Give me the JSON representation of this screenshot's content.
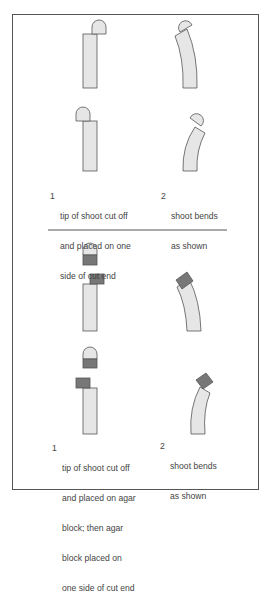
{
  "figure": {
    "top_experiment": {
      "step1_number": "1",
      "step1_caption": [
        "tip of shoot cut off",
        "and placed on one",
        "side of cut end"
      ],
      "step2_number": "2",
      "step2_caption": [
        "shoot bends",
        "as shown"
      ]
    },
    "bottom_experiment": {
      "step1_number": "1",
      "step1_caption": [
        "tip of shoot cut off",
        "and placed on agar",
        "block; then agar",
        "block placed on",
        "one side of cut end"
      ],
      "step2_number": "2",
      "step2_caption": [
        "shoot bends",
        "as shown"
      ]
    },
    "colors": {
      "stem_fill": "#e6e6e6",
      "agar_fill": "#777777",
      "outline": "#555555",
      "text": "#444444"
    }
  }
}
